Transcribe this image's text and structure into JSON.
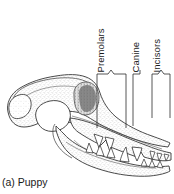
{
  "figure": {
    "caption": "(a) Puppy",
    "background_color": "#ffffff",
    "line_color": "#2b2b2b",
    "stipple_color": "#8c8c8c"
  },
  "labels": {
    "premolars": "Premolars",
    "canine": "Canine",
    "incisors": "Incisors"
  },
  "brackets": [
    {
      "name": "premolars",
      "label": "Premolars",
      "type": "wide-bracket",
      "x_start": 97,
      "x_end": 126,
      "peak_x": 111,
      "top_y": 71,
      "bottom_y": 128
    },
    {
      "name": "canine",
      "label": "Canine",
      "type": "single-leader-line",
      "x_start": 133,
      "x_end": 140,
      "top_y": 71,
      "bottom_y": 126
    },
    {
      "name": "incisors",
      "label": "Incisors",
      "type": "wide-bracket",
      "x_start": 152,
      "x_end": 170,
      "peak_x": 161,
      "top_y": 71,
      "bottom_y": 118
    }
  ],
  "anatomy": {
    "parts": [
      "cranium",
      "zygomatic-arch",
      "orbit",
      "maxilla",
      "mandible",
      "upper-teeth",
      "lower-teeth"
    ]
  }
}
